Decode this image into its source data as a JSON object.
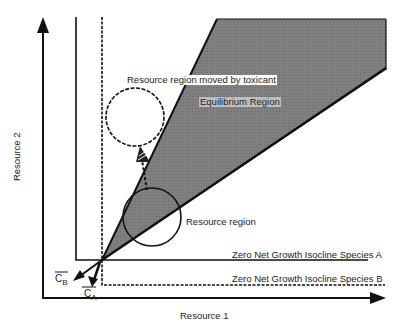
{
  "diagram": {
    "axes": {
      "x_label": "Resource 1",
      "y_label": "Resource 2"
    },
    "regions": {
      "equilibrium": "Equilibrium Region",
      "resource": "Resource region",
      "resource_moved": "Resource region moved by toxicant"
    },
    "isoclines": {
      "species_a": "Zero Net Growth Isocline Species A",
      "species_b": "Zero Net Growth Isocline Species B"
    },
    "vectors": {
      "cb": "C",
      "cb_sub": "B",
      "ca": "C",
      "ca_sub": "A"
    },
    "colors": {
      "shade": "#7a7a7a",
      "line": "#111111"
    }
  }
}
